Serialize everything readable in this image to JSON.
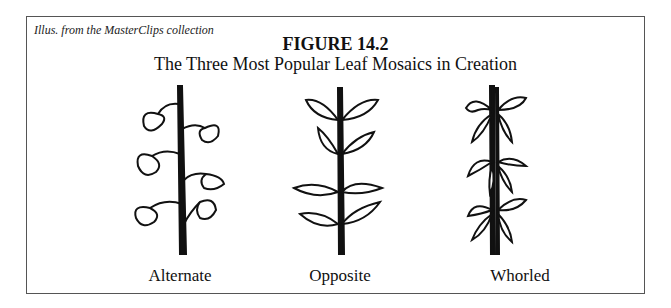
{
  "figure": {
    "credit": "Illus. from the MasterClips collection",
    "title": "FIGURE 14.2",
    "subtitle": "The Three Most Popular Leaf Mosaics in Creation"
  },
  "panels": [
    {
      "caption": "Alternate",
      "icon": "alternate-leaf-illustration"
    },
    {
      "caption": "Opposite",
      "icon": "opposite-leaf-illustration"
    },
    {
      "caption": "Whorled",
      "icon": "whorled-leaf-illustration"
    }
  ]
}
